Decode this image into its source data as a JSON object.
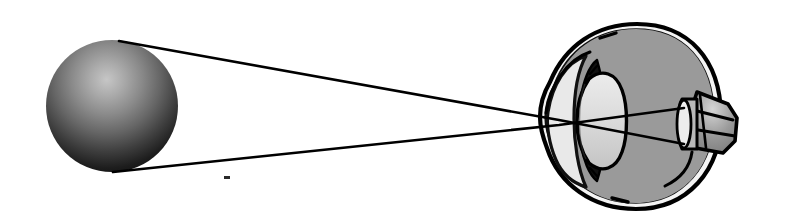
{
  "figure": {
    "description": "A shaded spherical object at left emits two light rays that converge through the cornea and lens of a sectioned human eye and form an inverted image on the retina near the optic nerve.",
    "width": 787,
    "height": 224,
    "background_color": "#ffffff"
  },
  "colors": {
    "ink": "#111111",
    "outline": "#000000",
    "sclera_white": "#f2f2f2",
    "vitreous_gray": "#9a9a9a",
    "lens_light": "#d8d8d8",
    "aqueous_light": "#e6e6e6",
    "sphere_highlight": "#b8b8b8",
    "sphere_mid": "#6a6a6a",
    "sphere_dark": "#121212",
    "nerve_gray": "#9a9a9a",
    "page_white": "#ffffff"
  },
  "object": {
    "name": "luminous sphere",
    "shape": "sphere",
    "center_x": 112,
    "center_y": 106,
    "radius": 66,
    "highlight_x": 142,
    "highlight_y": 62,
    "shading": "radial gradient, highlight upper-right, shadow lower-left"
  },
  "rays": [
    {
      "id": "upper-ray",
      "label": "ray from top of object",
      "start_x": 119,
      "start_y": 41,
      "node_x": 559,
      "node_y": 120,
      "end_x": 684,
      "end_y": 144,
      "stroke_width": 2.4
    },
    {
      "id": "lower-ray",
      "label": "ray from bottom of object",
      "start_x": 113,
      "start_y": 172,
      "node_x": 559,
      "node_y": 125,
      "end_x": 684,
      "end_y": 108,
      "stroke_width": 2.4
    }
  ],
  "eye": {
    "name": "human eye in cross section",
    "center_x": 637,
    "center_y": 116,
    "radius_x": 78,
    "radius_y": 87,
    "parts": [
      {
        "id": "sclera",
        "label": "sclera",
        "fill": "#f2f2f2"
      },
      {
        "id": "choroid-retina",
        "label": "choroid and retina",
        "fill": "#9a9a9a"
      },
      {
        "id": "vitreous",
        "label": "vitreous body",
        "fill": "#9a9a9a"
      },
      {
        "id": "cornea",
        "label": "cornea",
        "fill": "#e6e6e6"
      },
      {
        "id": "anterior-chamber",
        "label": "anterior chamber",
        "fill": "#e6e6e6"
      },
      {
        "id": "iris",
        "label": "iris",
        "fill": "#111111"
      },
      {
        "id": "lens",
        "label": "lens",
        "fill": "#d8d8d8"
      },
      {
        "id": "optic-nerve",
        "label": "optic nerve",
        "fill": "#9a9a9a"
      },
      {
        "id": "optic-disc",
        "label": "optic disc",
        "fill": "#d8d8d8"
      }
    ]
  },
  "artifacts": [
    {
      "id": "scan-speck",
      "label": "scan speck",
      "x": 226,
      "y": 177,
      "width": 6,
      "height": 3
    }
  ]
}
